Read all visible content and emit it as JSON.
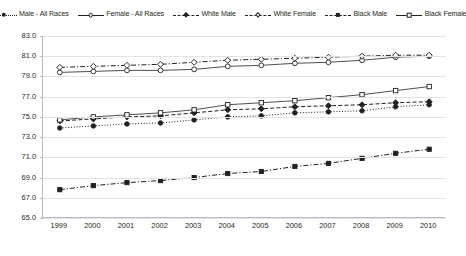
{
  "chart_data": {
    "type": "line",
    "title": "",
    "xlabel": "",
    "ylabel": "",
    "x": [
      1999,
      2000,
      2001,
      2002,
      2003,
      2004,
      2005,
      2006,
      2007,
      2008,
      2009,
      2010
    ],
    "categories": [
      "1999",
      "2000",
      "2001",
      "2002",
      "2003",
      "2004",
      "2005",
      "2006",
      "2007",
      "2008",
      "2009",
      "2010"
    ],
    "ylim": [
      65.0,
      83.0
    ],
    "ytick_labels": [
      "83.0",
      "81.0",
      "79.0",
      "77.0",
      "75.0",
      "73.0",
      "71.0",
      "69.0",
      "67.0",
      "65.0"
    ],
    "ytick_values": [
      83.0,
      81.0,
      79.0,
      77.0,
      75.0,
      73.0,
      71.0,
      69.0,
      67.0,
      65.0
    ],
    "grid": true,
    "legend_position": "top",
    "series": [
      {
        "name": "Male - All Races",
        "marker": "filled-circle",
        "line_style": "dotted",
        "values": [
          73.9,
          74.1,
          74.3,
          74.4,
          74.7,
          75.0,
          75.1,
          75.4,
          75.5,
          75.6,
          76.0,
          76.2
        ]
      },
      {
        "name": "Female - All Races",
        "marker": "open-circle",
        "line_style": "solid",
        "values": [
          79.4,
          79.5,
          79.6,
          79.6,
          79.7,
          80.0,
          80.1,
          80.3,
          80.4,
          80.6,
          80.9,
          81.0
        ]
      },
      {
        "name": "White Male",
        "marker": "filled-diamond",
        "line_style": "dashed",
        "values": [
          74.6,
          74.8,
          75.0,
          75.1,
          75.4,
          75.7,
          75.8,
          76.0,
          76.1,
          76.2,
          76.4,
          76.5
        ]
      },
      {
        "name": "White Female",
        "marker": "open-diamond",
        "line_style": "dash-dot",
        "values": [
          79.9,
          80.0,
          80.1,
          80.2,
          80.4,
          80.6,
          80.7,
          80.8,
          80.9,
          81.0,
          81.1,
          81.1
        ]
      },
      {
        "name": "Black Male",
        "marker": "filled-square",
        "line_style": "dash-dot",
        "values": [
          67.8,
          68.2,
          68.5,
          68.7,
          69.0,
          69.4,
          69.6,
          70.1,
          70.4,
          70.9,
          71.4,
          71.8
        ]
      },
      {
        "name": "Black Female",
        "marker": "open-square",
        "line_style": "solid",
        "values": [
          74.7,
          75.0,
          75.2,
          75.4,
          75.7,
          76.2,
          76.4,
          76.6,
          76.9,
          77.2,
          77.6,
          78.0
        ]
      }
    ]
  }
}
